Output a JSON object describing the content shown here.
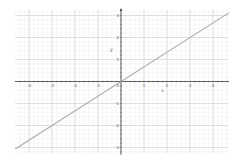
{
  "chart_data": {
    "type": "line",
    "title": "",
    "xlabel": "x",
    "ylabel": "y",
    "xlim": [
      -4.6,
      4.7
    ],
    "ylim": [
      -3.2,
      3.2
    ],
    "grid": true,
    "minor_grid": true,
    "minor_per_major": 5,
    "x_ticks": [
      -4,
      -3,
      -2,
      -1,
      1,
      2,
      3,
      4
    ],
    "x_tick_labels": [
      "-4",
      "-3",
      "-2",
      "-1",
      "1",
      "2",
      "3",
      "4"
    ],
    "y_ticks": [
      3,
      2,
      1,
      -1,
      -2,
      -3
    ],
    "y_tick_labels": [
      "3",
      "2",
      "1",
      "-1",
      "-2",
      "-3"
    ],
    "origin_label": "0",
    "series": [
      {
        "name": "f(x) = 2/3 x",
        "equation": "y = 2/3 x",
        "slope": 0.667,
        "intercept": 0,
        "x": [
          -4.6,
          4.7
        ],
        "y": [
          -3.07,
          3.13
        ],
        "color": "#aaaaaa"
      }
    ],
    "legend": null
  },
  "style": {
    "axis_color": "#444444",
    "major_grid_color": "#d6d6d6",
    "minor_grid_color": "#eeeeee",
    "line_color": "#aaaaaa",
    "background": "#ffffff"
  },
  "frame": {
    "left": 15,
    "top": 10,
    "right": 229,
    "bottom": 153,
    "origin_px": [
      121,
      81.5
    ],
    "unit_px_x": 23,
    "unit_px_y": 22
  }
}
